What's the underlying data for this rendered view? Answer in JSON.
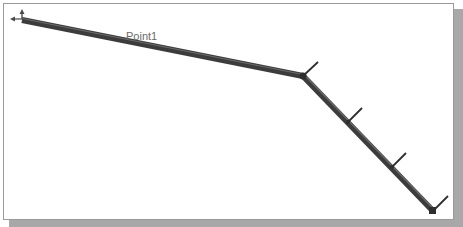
{
  "viewport": {
    "frame_color": "#9a9a9a",
    "shadow_color": "#a8a8a8",
    "background": "#ffffff"
  },
  "model": {
    "beam_color": "#3c3c3c",
    "beam_highlight": "#6a6a6a",
    "tick_color": "#2e2e2e",
    "segments": [
      {
        "from": [
          22,
          20
        ],
        "to": [
          303,
          76
        ]
      },
      {
        "from": [
          303,
          76
        ],
        "to": [
          433,
          211
        ]
      }
    ],
    "ticks": [
      {
        "at": [
          303,
          76
        ],
        "to": [
          318,
          62
        ]
      },
      {
        "at": [
          348,
          122
        ],
        "to": [
          362,
          108
        ]
      },
      {
        "at": [
          392,
          167
        ],
        "to": [
          406,
          153
        ]
      },
      {
        "at": [
          433,
          211
        ],
        "to": [
          448,
          196
        ]
      }
    ],
    "point_label": {
      "text": "Point1",
      "x": 126,
      "y": 40
    }
  }
}
